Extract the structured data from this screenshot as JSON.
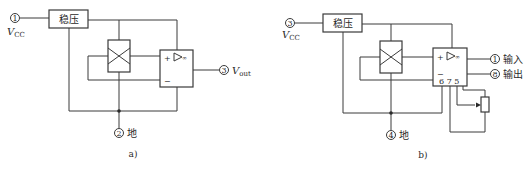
{
  "figure": {
    "panel_a": {
      "caption": "a)",
      "regulator_label": "稳压",
      "pins": {
        "vcc": {
          "number": "①",
          "label": "V",
          "sub": "CC"
        },
        "ground": {
          "number": "②",
          "label": "地"
        },
        "output": {
          "number": "③",
          "label": "V",
          "sub": "out"
        }
      },
      "amp": {
        "plus": "+",
        "minus": "−",
        "symbol": "▷∞"
      }
    },
    "panel_b": {
      "caption": "b)",
      "regulator_label": "稳压",
      "pins": {
        "vcc": {
          "number": "③",
          "label": "V",
          "sub": "CC"
        },
        "ground": {
          "number": "④",
          "label": "地"
        },
        "input": {
          "number": "①",
          "label": "输入"
        },
        "output": {
          "number": "⑧",
          "label": "输出"
        }
      },
      "amp": {
        "plus": "+",
        "minus": "−",
        "symbol": "▷∞",
        "pin_numbers": "6 7 5"
      }
    }
  }
}
